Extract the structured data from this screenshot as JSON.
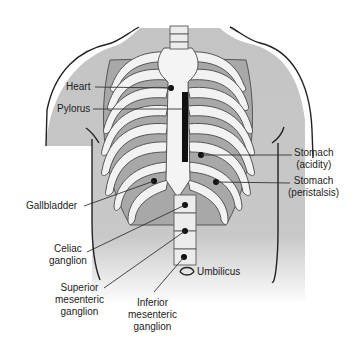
{
  "figure": {
    "type": "anatomical-diagram",
    "colors": {
      "background": "#ffffff",
      "skin_shade": "#c8c8c8",
      "bone": "#f2f2f2",
      "bone_outline": "#555555",
      "intercostal": "#a8a8a8",
      "marker": "#111111",
      "leader_line": "#333333"
    }
  },
  "labels": {
    "heart": "Heart",
    "pylorus": "Pylorus",
    "stomach_acidity_1": "Stomach",
    "stomach_acidity_2": "(acidity)",
    "stomach_peristalsis_1": "Stomach",
    "stomach_peristalsis_2": "(peristalsis)",
    "gallbladder": "Gallbladder",
    "celiac_1": "Celiac",
    "celiac_2": "ganglion",
    "superior_1": "Superior",
    "superior_2": "mesenteric",
    "superior_3": "ganglion",
    "inferior_1": "Inferior",
    "inferior_2": "mesenteric",
    "inferior_3": "ganglion",
    "umbilicus": "Umbilicus"
  }
}
